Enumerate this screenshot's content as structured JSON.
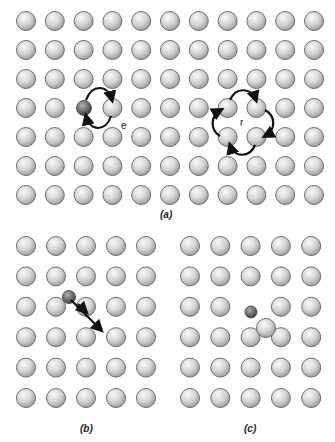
{
  "diagram": {
    "type": "atomic diffusion mechanisms in a crystal lattice",
    "colors": {
      "atom_fill_light": "#f2f2f2",
      "atom_fill_dark": "#a8a8a8",
      "atom_stroke": "#6e6e6e",
      "solute_fill_light": "#9a9a9a",
      "solute_fill_dark": "#3c3c3c",
      "arrow": "#111111"
    },
    "panels": [
      {
        "id": "a",
        "label": "(a)",
        "grid": {
          "cols": 11,
          "rows": 7
        },
        "annotations": [
          {
            "text": "e",
            "meaning": "direct exchange"
          },
          {
            "text": "r",
            "meaning": "ring mechanism"
          }
        ]
      },
      {
        "id": "b",
        "label": "(b)",
        "grid": {
          "cols": 5,
          "rows": 6
        }
      },
      {
        "id": "c",
        "label": "(c)",
        "grid": {
          "cols": 5,
          "rows": 6
        }
      }
    ],
    "labels": {
      "a": "(a)",
      "b": "(b)",
      "c": "(c)",
      "e": "e",
      "r": "r"
    }
  }
}
